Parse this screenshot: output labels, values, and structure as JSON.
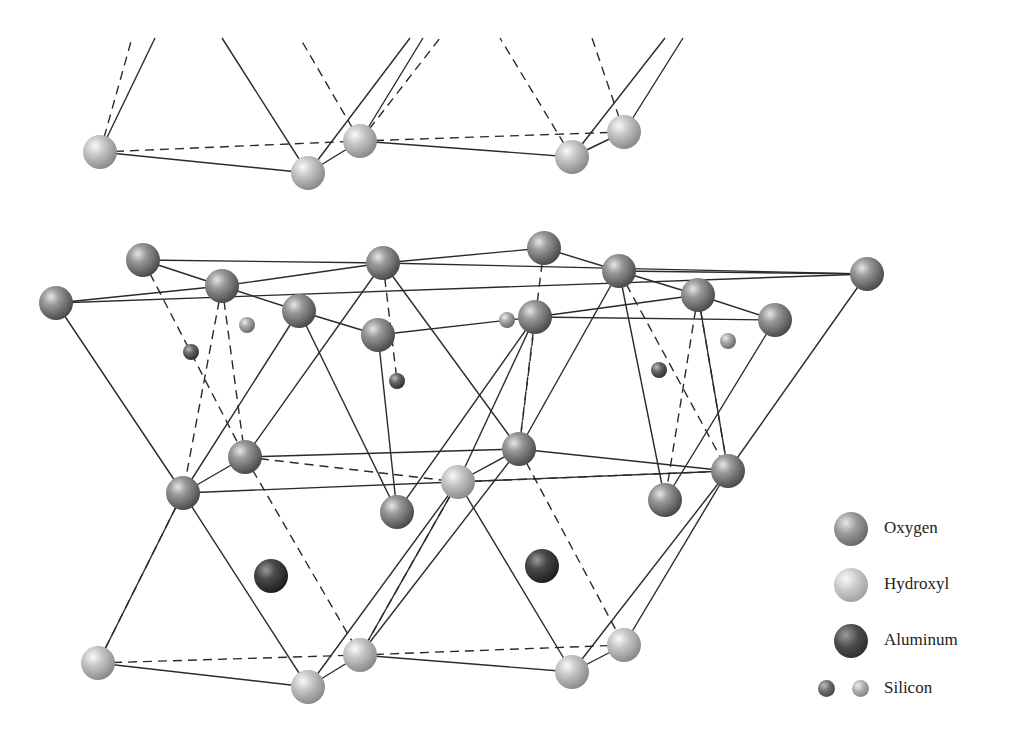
{
  "figure": {
    "colors": {
      "oxygen": "#7a7a7a",
      "hydroxyl": "#bdbdbd",
      "aluminum": "#3a3a3a",
      "silicon_dark": "#5e5e5e",
      "silicon_light": "#a4a4a4",
      "bond": "#2a2a2a",
      "background": "#ffffff"
    }
  },
  "legend": {
    "items": [
      {
        "key": "oxygen",
        "label": "Oxygen",
        "icon": "oxygen-sphere-icon"
      },
      {
        "key": "hydroxyl",
        "label": "Hydroxyl",
        "icon": "hydroxyl-sphere-icon"
      },
      {
        "key": "aluminum",
        "label": "Aluminum",
        "icon": "aluminum-sphere-icon"
      },
      {
        "key": "silicon",
        "label": "Silicon",
        "icon": "silicon-sphere-icon"
      }
    ]
  },
  "atoms": [
    {
      "type": "hydroxyl",
      "x": 100,
      "y": 152,
      "r": 17
    },
    {
      "type": "hydroxyl",
      "x": 308,
      "y": 173,
      "r": 17
    },
    {
      "type": "hydroxyl",
      "x": 360,
      "y": 141,
      "r": 17
    },
    {
      "type": "hydroxyl",
      "x": 572,
      "y": 157,
      "r": 17
    },
    {
      "type": "hydroxyl",
      "x": 624,
      "y": 132,
      "r": 17
    },
    {
      "type": "oxygen",
      "x": 143,
      "y": 260,
      "r": 17
    },
    {
      "type": "oxygen",
      "x": 222,
      "y": 286,
      "r": 17
    },
    {
      "type": "oxygen",
      "x": 56,
      "y": 303,
      "r": 17
    },
    {
      "type": "oxygen",
      "x": 383,
      "y": 263,
      "r": 17
    },
    {
      "type": "oxygen",
      "x": 299,
      "y": 311,
      "r": 17
    },
    {
      "type": "oxygen",
      "x": 378,
      "y": 335,
      "r": 17
    },
    {
      "type": "oxygen",
      "x": 544,
      "y": 248,
      "r": 17
    },
    {
      "type": "oxygen",
      "x": 619,
      "y": 271,
      "r": 17
    },
    {
      "type": "oxygen",
      "x": 698,
      "y": 295,
      "r": 17
    },
    {
      "type": "oxygen",
      "x": 867,
      "y": 274,
      "r": 17
    },
    {
      "type": "oxygen",
      "x": 775,
      "y": 320,
      "r": 17
    },
    {
      "type": "oxygen",
      "x": 535,
      "y": 317,
      "r": 17
    },
    {
      "type": "silicon_dark",
      "x": 191,
      "y": 352,
      "r": 8
    },
    {
      "type": "silicon_light",
      "x": 247,
      "y": 325,
      "r": 8
    },
    {
      "type": "silicon_dark",
      "x": 397,
      "y": 381,
      "r": 8
    },
    {
      "type": "silicon_light",
      "x": 507,
      "y": 320,
      "r": 8
    },
    {
      "type": "silicon_dark",
      "x": 659,
      "y": 370,
      "r": 8
    },
    {
      "type": "silicon_light",
      "x": 728,
      "y": 341,
      "r": 8
    },
    {
      "type": "oxygen",
      "x": 245,
      "y": 457,
      "r": 17
    },
    {
      "type": "oxygen",
      "x": 183,
      "y": 493,
      "r": 17
    },
    {
      "type": "oxygen",
      "x": 397,
      "y": 512,
      "r": 17
    },
    {
      "type": "hydroxyl",
      "x": 458,
      "y": 482,
      "r": 17
    },
    {
      "type": "oxygen",
      "x": 519,
      "y": 449,
      "r": 17
    },
    {
      "type": "oxygen",
      "x": 665,
      "y": 500,
      "r": 17
    },
    {
      "type": "oxygen",
      "x": 728,
      "y": 471,
      "r": 17
    },
    {
      "type": "aluminum",
      "x": 271,
      "y": 576,
      "r": 17
    },
    {
      "type": "aluminum",
      "x": 542,
      "y": 566,
      "r": 17
    },
    {
      "type": "hydroxyl",
      "x": 98,
      "y": 663,
      "r": 17
    },
    {
      "type": "hydroxyl",
      "x": 308,
      "y": 687,
      "r": 17
    },
    {
      "type": "hydroxyl",
      "x": 360,
      "y": 655,
      "r": 17
    },
    {
      "type": "hydroxyl",
      "x": 572,
      "y": 672,
      "r": 17
    },
    {
      "type": "hydroxyl",
      "x": 624,
      "y": 645,
      "r": 17
    }
  ],
  "bonds": {
    "solid": [
      [
        100,
        152,
        155,
        38
      ],
      [
        308,
        173,
        222,
        38
      ],
      [
        308,
        173,
        410,
        38
      ],
      [
        360,
        141,
        423,
        38
      ],
      [
        572,
        157,
        665,
        38
      ],
      [
        624,
        132,
        683,
        38
      ],
      [
        100,
        152,
        308,
        173
      ],
      [
        308,
        173,
        360,
        141
      ],
      [
        360,
        141,
        572,
        157
      ],
      [
        572,
        157,
        624,
        132
      ],
      [
        143,
        260,
        383,
        263
      ],
      [
        143,
        260,
        222,
        286
      ],
      [
        222,
        286,
        383,
        263
      ],
      [
        56,
        303,
        222,
        286
      ],
      [
        56,
        303,
        867,
        274
      ],
      [
        222,
        286,
        299,
        311
      ],
      [
        299,
        311,
        378,
        335
      ],
      [
        383,
        263,
        544,
        248
      ],
      [
        383,
        263,
        867,
        274
      ],
      [
        378,
        335,
        535,
        317
      ],
      [
        535,
        317,
        698,
        295
      ],
      [
        544,
        248,
        619,
        271
      ],
      [
        619,
        271,
        698,
        295
      ],
      [
        698,
        295,
        775,
        320
      ],
      [
        619,
        271,
        867,
        274
      ],
      [
        535,
        317,
        775,
        320
      ],
      [
        56,
        303,
        183,
        493
      ],
      [
        299,
        311,
        183,
        493
      ],
      [
        383,
        263,
        245,
        457
      ],
      [
        299,
        311,
        397,
        512
      ],
      [
        378,
        335,
        397,
        512
      ],
      [
        535,
        317,
        397,
        512
      ],
      [
        519,
        449,
        619,
        271
      ],
      [
        535,
        317,
        458,
        482
      ],
      [
        619,
        271,
        665,
        500
      ],
      [
        775,
        320,
        665,
        500
      ],
      [
        867,
        274,
        728,
        471
      ],
      [
        698,
        295,
        728,
        471
      ],
      [
        383,
        263,
        519,
        449
      ],
      [
        183,
        493,
        245,
        457
      ],
      [
        183,
        493,
        728,
        471
      ],
      [
        245,
        457,
        519,
        449
      ],
      [
        458,
        482,
        519,
        449
      ],
      [
        519,
        449,
        728,
        471
      ],
      [
        183,
        493,
        98,
        663
      ],
      [
        183,
        493,
        308,
        687
      ],
      [
        458,
        482,
        360,
        655
      ],
      [
        458,
        482,
        308,
        687
      ],
      [
        458,
        482,
        572,
        672
      ],
      [
        728,
        471,
        624,
        645
      ],
      [
        728,
        471,
        572,
        672
      ],
      [
        519,
        449,
        360,
        655
      ],
      [
        98,
        663,
        308,
        687
      ],
      [
        308,
        687,
        360,
        655
      ],
      [
        360,
        655,
        572,
        672
      ],
      [
        572,
        672,
        624,
        645
      ]
    ],
    "dashed": [
      [
        100,
        152,
        132,
        38
      ],
      [
        360,
        141,
        300,
        38
      ],
      [
        572,
        157,
        500,
        38
      ],
      [
        624,
        132,
        592,
        38
      ],
      [
        360,
        141,
        440,
        38
      ],
      [
        100,
        152,
        360,
        141
      ],
      [
        360,
        141,
        624,
        132
      ],
      [
        143,
        260,
        245,
        457
      ],
      [
        222,
        286,
        245,
        457
      ],
      [
        222,
        286,
        183,
        493
      ],
      [
        544,
        248,
        519,
        449
      ],
      [
        619,
        271,
        728,
        471
      ],
      [
        698,
        295,
        665,
        500
      ],
      [
        698,
        295,
        728,
        471
      ],
      [
        383,
        263,
        397,
        381
      ],
      [
        535,
        317,
        519,
        449
      ],
      [
        245,
        457,
        458,
        482
      ],
      [
        458,
        482,
        728,
        471
      ],
      [
        245,
        457,
        360,
        655
      ],
      [
        183,
        493,
        98,
        663
      ],
      [
        519,
        449,
        624,
        645
      ],
      [
        458,
        482,
        360,
        655
      ],
      [
        98,
        663,
        360,
        655
      ],
      [
        360,
        655,
        624,
        645
      ]
    ]
  }
}
